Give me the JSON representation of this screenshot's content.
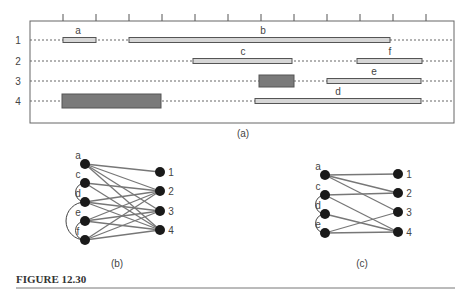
{
  "panel_a": {
    "caption": "(a)",
    "frame": {
      "x": 30,
      "y": 21,
      "w": 424,
      "h": 102
    },
    "ticks_x": [
      63,
      96,
      129,
      162,
      195,
      228,
      261,
      294,
      327,
      360,
      393,
      426
    ],
    "tracks": [
      {
        "label": "1",
        "y": 40
      },
      {
        "label": "2",
        "y": 61
      },
      {
        "label": "3",
        "y": 81
      },
      {
        "label": "4",
        "y": 101
      }
    ],
    "segments": [
      {
        "name": "a",
        "track": 1,
        "x1": 63,
        "x2": 96,
        "h": 5,
        "dark": false,
        "label_x": 78
      },
      {
        "name": "b",
        "track": 1,
        "x1": 129,
        "x2": 390,
        "h": 5,
        "dark": false,
        "label_x": 263
      },
      {
        "name": "c",
        "track": 2,
        "x1": 193,
        "x2": 292,
        "h": 5,
        "dark": false,
        "label_x": 243
      },
      {
        "name": "f",
        "track": 2,
        "x1": 357,
        "x2": 422,
        "h": 5,
        "dark": false,
        "label_x": 390
      },
      {
        "name": "",
        "track": 3,
        "x1": 259,
        "x2": 294,
        "h": 12,
        "dark": true,
        "label_x": 0
      },
      {
        "name": "e",
        "track": 3,
        "x1": 327,
        "x2": 421,
        "h": 5,
        "dark": false,
        "label_x": 374
      },
      {
        "name": "",
        "track": 4,
        "x1": 62,
        "x2": 161,
        "h": 14,
        "dark": true,
        "label_x": 0
      },
      {
        "name": "d",
        "track": 4,
        "x1": 255,
        "x2": 421,
        "h": 5,
        "dark": false,
        "label_x": 338
      }
    ]
  },
  "panel_b": {
    "caption": "(b)",
    "left_nodes": [
      {
        "name": "a",
        "x": 85,
        "y": 164
      },
      {
        "name": "c",
        "x": 85,
        "y": 183
      },
      {
        "name": "d",
        "x": 85,
        "y": 202
      },
      {
        "name": "e",
        "x": 85,
        "y": 221
      },
      {
        "name": "f",
        "x": 85,
        "y": 240
      }
    ],
    "right_nodes": [
      {
        "name": "1",
        "x": 160,
        "y": 172
      },
      {
        "name": "2",
        "x": 160,
        "y": 191
      },
      {
        "name": "3",
        "x": 160,
        "y": 211
      },
      {
        "name": "4",
        "x": 160,
        "y": 230
      }
    ],
    "edges": [
      [
        "a",
        "1"
      ],
      [
        "a",
        "2"
      ],
      [
        "a",
        "3"
      ],
      [
        "a",
        "4"
      ],
      [
        "c",
        "2"
      ],
      [
        "c",
        "4"
      ],
      [
        "d",
        "2"
      ],
      [
        "d",
        "3"
      ],
      [
        "d",
        "4"
      ],
      [
        "e",
        "2"
      ],
      [
        "e",
        "3"
      ],
      [
        "e",
        "4"
      ],
      [
        "f",
        "2"
      ],
      [
        "f",
        "3"
      ],
      [
        "f",
        "4"
      ]
    ],
    "arcs": [
      [
        "c",
        "d"
      ],
      [
        "d",
        "f"
      ],
      [
        "e",
        "f"
      ]
    ]
  },
  "panel_c": {
    "caption": "(c)",
    "left_nodes": [
      {
        "name": "a",
        "x": 325,
        "y": 175
      },
      {
        "name": "c",
        "x": 325,
        "y": 195
      },
      {
        "name": "d",
        "x": 325,
        "y": 214
      },
      {
        "name": "e",
        "x": 325,
        "y": 233
      }
    ],
    "right_nodes": [
      {
        "name": "1",
        "x": 398,
        "y": 174
      },
      {
        "name": "2",
        "x": 398,
        "y": 193
      },
      {
        "name": "3",
        "x": 398,
        "y": 212
      },
      {
        "name": "4",
        "x": 398,
        "y": 232
      }
    ],
    "edges": [
      [
        "a",
        "1"
      ],
      [
        "a",
        "2"
      ],
      [
        "a",
        "3"
      ],
      [
        "c",
        "2"
      ],
      [
        "c",
        "4"
      ],
      [
        "d",
        "4"
      ],
      [
        "e",
        "3"
      ],
      [
        "e",
        "4"
      ]
    ],
    "arcs": [
      [
        "c",
        "d"
      ],
      [
        "d",
        "e"
      ]
    ]
  },
  "figure_label": "FIGURE 12.30"
}
